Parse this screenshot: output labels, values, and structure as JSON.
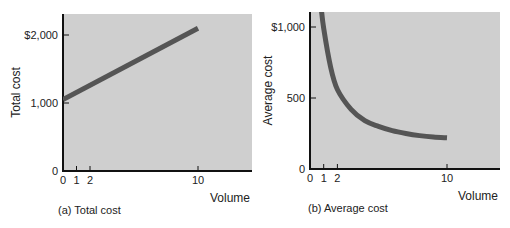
{
  "chart_data": [
    {
      "type": "line",
      "title": "",
      "caption": "(a) Total cost",
      "xlabel": "Volume",
      "ylabel": "Total cost",
      "x_ticks": [
        "0",
        "1",
        "2",
        "10"
      ],
      "y_ticks": [
        "0",
        "1,000",
        "$2,000"
      ],
      "xlim": [
        0,
        14
      ],
      "ylim": [
        0,
        2300
      ],
      "grid": false,
      "background": "#cfcfcf",
      "line_color": "#555555",
      "series": [
        {
          "name": "Total cost",
          "x": [
            0,
            10
          ],
          "y": [
            1050,
            2100
          ]
        }
      ]
    },
    {
      "type": "line",
      "title": "",
      "caption": "(b) Average cost",
      "xlabel": "Volume",
      "ylabel": "Average cost",
      "x_ticks": [
        "0",
        "1",
        "2",
        "10"
      ],
      "y_ticks": [
        "0",
        "500",
        "$1,000"
      ],
      "xlim": [
        0,
        14
      ],
      "ylim": [
        0,
        1150
      ],
      "grid": false,
      "background": "#cfcfcf",
      "line_color": "#555555",
      "series": [
        {
          "name": "Average cost",
          "x": [
            0.8,
            1,
            1.5,
            2,
            3,
            4,
            5,
            6,
            7,
            8,
            9,
            10
          ],
          "y": [
            1150,
            990,
            720,
            560,
            420,
            340,
            300,
            270,
            250,
            235,
            225,
            220
          ]
        }
      ]
    }
  ]
}
